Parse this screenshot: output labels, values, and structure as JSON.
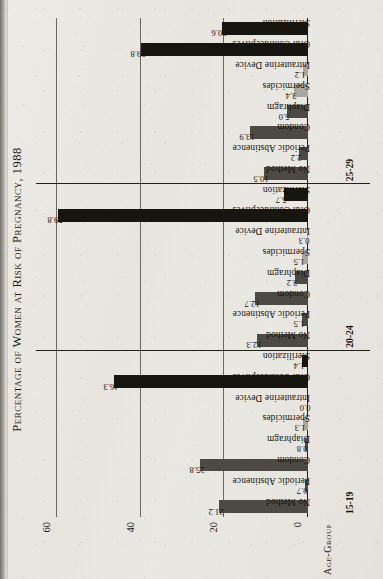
{
  "chart_data": {
    "type": "bar",
    "title": "Percentage of Women at Risk of Pregnancy, 1988",
    "xlabel": "Age-Group",
    "ylabel": "",
    "ylim": [
      0,
      65
    ],
    "yticks": [
      0,
      20,
      40,
      60
    ],
    "ytick_labels": [
      "0",
      "20",
      "40",
      "60"
    ],
    "grid": true,
    "legend": "none",
    "categories": [
      "No Method",
      "Periodic Abstinence",
      "Condom",
      "Diaphragm",
      "Spermicides",
      "Intrauterine Device",
      "Oral Contraceptives",
      "Sterilization"
    ],
    "groups": [
      {
        "name": "15-19",
        "values": [
          21.2,
          0.7,
          25.8,
          0.8,
          1.3,
          0.0,
          46.3,
          1.4
        ],
        "value_labels": [
          "21.2",
          "0.7",
          "25.8",
          "0.8",
          "1.3",
          "0.0",
          "46.3",
          "1.4"
        ]
      },
      {
        "name": "20-24",
        "values": [
          12.3,
          1.5,
          12.7,
          3.2,
          1.5,
          0.3,
          59.8,
          5.7
        ],
        "value_labels": [
          "12.3",
          "1.5",
          "12.7",
          "3.2",
          "1.5",
          "0.3",
          "59.8",
          "5.7"
        ]
      },
      {
        "name": "25-29",
        "values": [
          10.5,
          2.2,
          13.9,
          5.0,
          3.4,
          1.2,
          39.8,
          20.6
        ],
        "value_labels": [
          "10.5",
          "2.2",
          "13.9",
          "5.0",
          "3.4",
          "1.2",
          "39.8",
          "20.6"
        ]
      }
    ],
    "bar_colors": [
      "#4d4a44",
      "#4d4a44",
      "#4d4a44",
      "#4d4a44",
      "#a9a69f",
      "#a9a69f",
      "#17150f",
      "#17150f"
    ]
  },
  "colors": {
    "paper": "#e9e7e1",
    "ink": "#17150f",
    "rule": "#232119",
    "gridline": "#54514b",
    "bar_dark": "#4d4a44",
    "bar_black": "#17150f",
    "bar_light": "#a9a69f"
  }
}
